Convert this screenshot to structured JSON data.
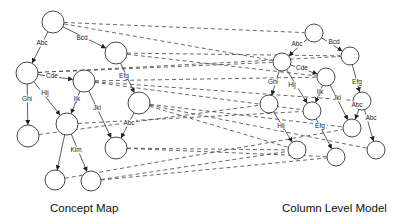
{
  "captions": {
    "left": "Concept Map",
    "right": "Column Level Model"
  },
  "colors": {
    "stroke": "#333333",
    "background": "#ffffff"
  },
  "concept_map": {
    "nodes": [
      {
        "id": "L1",
        "x": 53,
        "y": 22,
        "r": 11
      },
      {
        "id": "L2",
        "x": 116,
        "y": 53,
        "r": 11
      },
      {
        "id": "L3",
        "x": 27,
        "y": 73,
        "r": 11
      },
      {
        "id": "L4",
        "x": 84,
        "y": 81,
        "r": 11
      },
      {
        "id": "L5",
        "x": 139,
        "y": 103,
        "r": 11
      },
      {
        "id": "L6",
        "x": 28,
        "y": 136,
        "r": 11
      },
      {
        "id": "L7",
        "x": 67,
        "y": 124,
        "r": 11
      },
      {
        "id": "L8",
        "x": 116,
        "y": 148,
        "r": 11
      },
      {
        "id": "L9",
        "x": 55,
        "y": 180,
        "r": 10
      },
      {
        "id": "L10",
        "x": 91,
        "y": 181,
        "r": 10
      }
    ],
    "edges": [
      {
        "from": "L1",
        "to": "L3",
        "label": "Abc",
        "lx": 42,
        "ly": 45
      },
      {
        "from": "L1",
        "to": "L2",
        "label": "Bcd",
        "lx": 82,
        "ly": 40
      },
      {
        "from": "L3",
        "to": "L4",
        "label": "Cde",
        "lx": 52,
        "ly": 78
      },
      {
        "from": "L2",
        "to": "L5",
        "label": "Efg",
        "lx": 124,
        "ly": 78
      },
      {
        "from": "L3",
        "to": "L6",
        "label": "Ghi",
        "lx": 27,
        "ly": 101
      },
      {
        "from": "L3",
        "to": "L7",
        "label": "Hij",
        "lx": 45,
        "ly": 95
      },
      {
        "from": "L4",
        "to": "L7",
        "label": "Ijk",
        "lx": 77,
        "ly": 101
      },
      {
        "from": "L4",
        "to": "L8",
        "label": "Jkl",
        "lx": 97,
        "ly": 110
      },
      {
        "from": "L5",
        "to": "L8",
        "label": "Abc",
        "lx": 129,
        "ly": 125
      },
      {
        "from": "L7",
        "to": "L9",
        "label": "Klm",
        "lx": 76,
        "ly": 152
      },
      {
        "from": "L7",
        "to": "L10",
        "label": "",
        "lx": 0,
        "ly": 0
      }
    ]
  },
  "column_model": {
    "nodes": [
      {
        "id": "R1",
        "x": 314,
        "y": 33,
        "r": 9
      },
      {
        "id": "R2",
        "x": 350,
        "y": 56,
        "r": 9
      },
      {
        "id": "R3",
        "x": 282,
        "y": 62,
        "r": 9
      },
      {
        "id": "R4",
        "x": 326,
        "y": 77,
        "r": 9
      },
      {
        "id": "R5",
        "x": 269,
        "y": 104,
        "r": 9
      },
      {
        "id": "R6",
        "x": 362,
        "y": 101,
        "r": 9
      },
      {
        "id": "R7",
        "x": 312,
        "y": 111,
        "r": 9
      },
      {
        "id": "R8",
        "x": 352,
        "y": 128,
        "r": 9
      },
      {
        "id": "R9",
        "x": 297,
        "y": 150,
        "r": 9
      },
      {
        "id": "R10",
        "x": 336,
        "y": 157,
        "r": 9
      },
      {
        "id": "R11",
        "x": 376,
        "y": 150,
        "r": 9
      }
    ],
    "edges": [
      {
        "from": "R1",
        "to": "R3",
        "label": "Abc",
        "lx": 297,
        "ly": 46
      },
      {
        "from": "R1",
        "to": "R2",
        "label": "Bcd",
        "lx": 334,
        "ly": 44
      },
      {
        "from": "R3",
        "to": "R4",
        "label": "Cde",
        "lx": 302,
        "ly": 70
      },
      {
        "from": "R2",
        "to": "R6",
        "label": "Efg",
        "lx": 357,
        "ly": 84
      },
      {
        "from": "R3",
        "to": "R5",
        "label": "Ghi",
        "lx": 273,
        "ly": 84
      },
      {
        "from": "R3",
        "to": "R7",
        "label": "Hij",
        "lx": 292,
        "ly": 87
      },
      {
        "from": "R4",
        "to": "R7",
        "label": "Ijk",
        "lx": 320,
        "ly": 94
      },
      {
        "from": "R4",
        "to": "R8",
        "label": "Jkl",
        "lx": 337,
        "ly": 100
      },
      {
        "from": "R6",
        "to": "R8",
        "label": "Abc",
        "lx": 357,
        "ly": 107
      },
      {
        "from": "R6",
        "to": "R11",
        "label": "Abc",
        "lx": 371,
        "ly": 120
      },
      {
        "from": "R5",
        "to": "R9",
        "label": "Hij",
        "lx": 281,
        "ly": 128
      },
      {
        "from": "R7",
        "to": "R10",
        "label": "Efg",
        "lx": 320,
        "ly": 128
      }
    ]
  },
  "mappings": [
    [
      "L1",
      "R1"
    ],
    [
      "L1",
      "R3"
    ],
    [
      "L2",
      "R2"
    ],
    [
      "L2",
      "R4"
    ],
    [
      "L3",
      "R2"
    ],
    [
      "L3",
      "R3"
    ],
    [
      "L4",
      "R4"
    ],
    [
      "L4",
      "R7"
    ],
    [
      "L4",
      "R6"
    ],
    [
      "L5",
      "R9"
    ],
    [
      "L5",
      "R8"
    ],
    [
      "L5",
      "R11"
    ],
    [
      "L6",
      "R5"
    ],
    [
      "L7",
      "R7"
    ],
    [
      "L8",
      "R9"
    ],
    [
      "L8",
      "R10"
    ],
    [
      "L9",
      "R8"
    ],
    [
      "L10",
      "R10"
    ],
    [
      "L10",
      "R9"
    ]
  ]
}
